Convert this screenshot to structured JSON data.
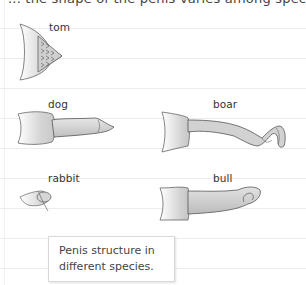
{
  "header": {
    "cut_off_text": "... the shape of the penis varies among species ..."
  },
  "figures": [
    {
      "id": "tom",
      "label": "tom"
    },
    {
      "id": "dog",
      "label": "dog"
    },
    {
      "id": "boar",
      "label": "boar"
    },
    {
      "id": "rabbit",
      "label": "rabbit"
    },
    {
      "id": "bull",
      "label": "bull"
    }
  ],
  "caption": {
    "line1": "Penis structure in",
    "line2": "different species."
  },
  "colors": {
    "ruled_line": "#ececec",
    "ink": "#555555",
    "shade_light": "#efefef",
    "shade_mid": "#cfcfcf",
    "shade_dark": "#a9a9a9"
  }
}
